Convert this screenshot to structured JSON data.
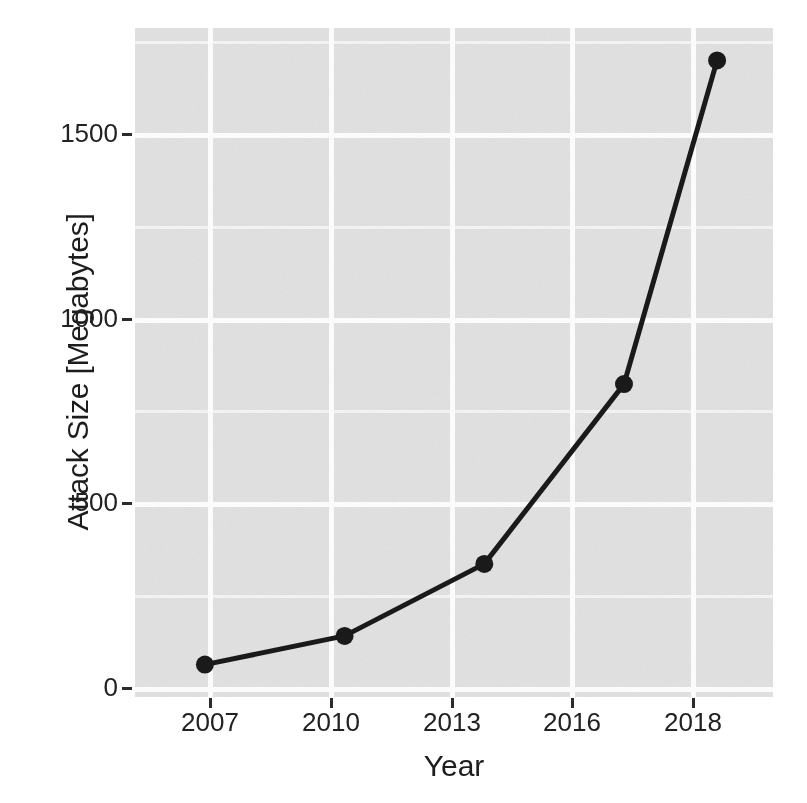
{
  "chart_data": {
    "type": "line",
    "title": "",
    "subtitle": "",
    "xlabel": "Year",
    "ylabel": "Attack Size [Megabytes]",
    "x": [
      2007,
      2010,
      2013,
      2016,
      2018
    ],
    "categories": [
      "2007",
      "2010",
      "2013",
      "2016",
      "2018"
    ],
    "values": [
      20,
      100,
      300,
      800,
      1700
    ],
    "series": [
      {
        "name": "Attack Size",
        "values": [
          20,
          100,
          300,
          800,
          1700
        ],
        "color": "#1a1a1a",
        "marker": "circle",
        "line_width": 4
      }
    ],
    "xlim": [
      2005.5,
      2019.2
    ],
    "ylim": [
      -70,
      1790
    ],
    "x_ticks": [
      2007,
      2010,
      2013,
      2016,
      2018
    ],
    "x_tick_labels": [
      "2007",
      "2010",
      "2013",
      "2016",
      "2018"
    ],
    "y_ticks": [
      0,
      500,
      1000,
      1500
    ],
    "y_tick_labels": [
      "0",
      "500",
      "1000",
      "1500"
    ],
    "grid": true,
    "grid_major_color": "#fbfbfb",
    "grid_minor_color": "#f2f2f2",
    "panel_background": "#e2e2e2",
    "page_background": "#ffffff",
    "legend": null,
    "legend_position": "none",
    "annotations": []
  },
  "axes": {
    "y_title": "Attack Size [Megabytes]",
    "x_title": "Year",
    "y_tick_labels": [
      "1500",
      "1000",
      "500",
      "0"
    ],
    "x_tick_labels": [
      "2007",
      "2010",
      "2013",
      "2016",
      "2018"
    ]
  }
}
